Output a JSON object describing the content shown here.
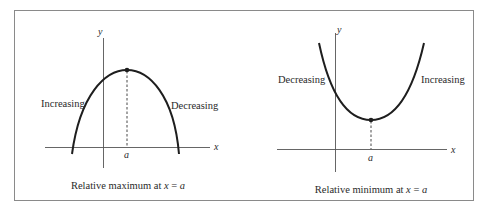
{
  "figure": {
    "panels": [
      {
        "id": "maximum",
        "axis_x_label": "x",
        "axis_y_label": "y",
        "point_label": "a",
        "left_label": "Increasing",
        "right_label": "Decreasing",
        "caption_text": "Relative maximum at ",
        "caption_var": "x",
        "caption_eq": " = ",
        "caption_val": "a"
      },
      {
        "id": "minimum",
        "axis_x_label": "x",
        "axis_y_label": "y",
        "point_label": "a",
        "left_label": "Decreasing",
        "right_label": "Increasing",
        "caption_text": "Relative minimum at ",
        "caption_var": "x",
        "caption_eq": " = ",
        "caption_val": "a"
      }
    ],
    "colors": {
      "frame": "#8a8a8a",
      "curve": "#1e1e1e",
      "axis": "#555555",
      "text": "#2a2a2a"
    }
  }
}
